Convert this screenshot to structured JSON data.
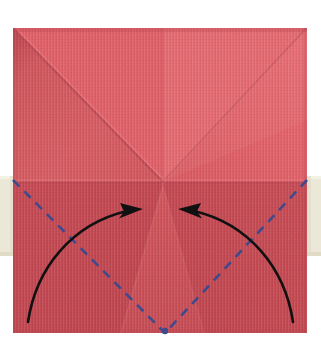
{
  "figure": {
    "title": "Origami fold step diagram",
    "canvas": {
      "width": 321,
      "height": 351,
      "background": "#ffffff"
    }
  },
  "colors": {
    "background": "#ffffff",
    "paper_light": "#e4636a",
    "paper_mid": "#dc5a62",
    "paper_dark": "#cf4f58",
    "paper_shadow": "#c44a53",
    "paper_edge": "#b8434c",
    "crease_line": "#c2505a",
    "crease_highlight": "#ea7078",
    "fold_line_blue": "#3f4a8c",
    "arrow_black": "#111111",
    "tape": "#ece8d8",
    "tape_edge": "#ded9c4"
  },
  "paper": {
    "label": "red square origami paper",
    "x": 13,
    "y": 28,
    "width": 294,
    "height": 305
  },
  "tape_strips": [
    {
      "label": "left tape strip",
      "x": 0,
      "y": 176,
      "width": 14,
      "height": 80
    },
    {
      "label": "right tape strip",
      "x": 307,
      "y": 176,
      "width": 14,
      "height": 80
    }
  ],
  "center_point": {
    "x": 163,
    "y": 182
  },
  "creases": [
    {
      "name": "diagonal-top-left-to-center",
      "x1": 13,
      "y1": 28,
      "x2": 163,
      "y2": 182
    },
    {
      "name": "diagonal-top-right-to-center",
      "x1": 307,
      "y1": 28,
      "x2": 163,
      "y2": 182
    },
    {
      "name": "vertical-center-upper",
      "x1": 163,
      "y1": 28,
      "x2": 163,
      "y2": 182
    },
    {
      "name": "horizontal-mid",
      "x1": 13,
      "y1": 182,
      "x2": 307,
      "y2": 182
    },
    {
      "name": "diagonal-center-to-bottom-left",
      "x1": 163,
      "y1": 182,
      "x2": 120,
      "y2": 333
    },
    {
      "name": "diagonal-center-to-bottom-right",
      "x1": 163,
      "y1": 182,
      "x2": 205,
      "y2": 333
    }
  ],
  "fold_lines": [
    {
      "name": "left-valley-fold",
      "style": "dashed",
      "color": "#3f4a8c",
      "x1": 13,
      "y1": 180,
      "x2": 165,
      "y2": 333
    },
    {
      "name": "right-valley-fold",
      "style": "dashed",
      "color": "#3f4a8c",
      "x1": 307,
      "y1": 180,
      "x2": 165,
      "y2": 333
    }
  ],
  "arrows": [
    {
      "name": "left-fold-arrow",
      "direction": "right",
      "path": "M 28 322 C 40 265, 78 222, 128 212",
      "head_tip": {
        "x": 140,
        "y": 210
      },
      "color": "#111111"
    },
    {
      "name": "right-fold-arrow",
      "direction": "left",
      "path": "M 293 322 C 281 265, 243 222, 193 212",
      "head_tip": {
        "x": 181,
        "y": 210
      },
      "color": "#111111"
    }
  ],
  "annotations": {
    "fold_line_meaning": "valley fold",
    "arrow_meaning": "fold corner up to center"
  }
}
